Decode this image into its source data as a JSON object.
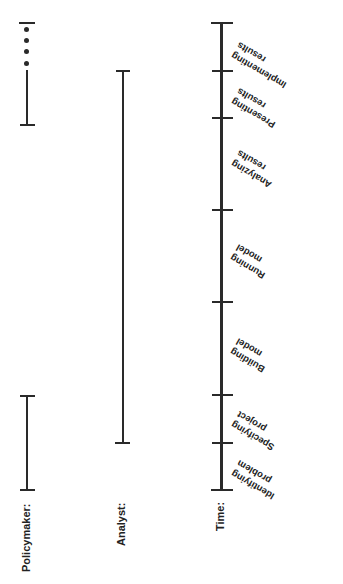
{
  "lanes": {
    "policymaker": {
      "label": "Policymaker:"
    },
    "analyst": {
      "label": "Analyst:"
    },
    "time": {
      "label": "Time:"
    }
  },
  "stages": [
    {
      "line1": "Implementing",
      "line2": "results"
    },
    {
      "line1": "Presenting",
      "line2": "results"
    },
    {
      "line1": "Analyzing",
      "line2": "results"
    },
    {
      "line1": "Running",
      "line2": "model"
    },
    {
      "line1": "Building",
      "line2": "model"
    },
    {
      "line1": "Specifying",
      "line2": "project"
    },
    {
      "line1": "Identifying",
      "line2": "problem"
    }
  ],
  "colors": {
    "line": "#2a2a2a",
    "background": "#ffffff"
  }
}
